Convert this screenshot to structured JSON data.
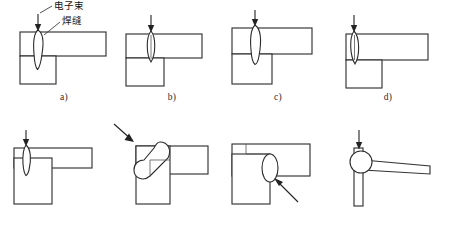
{
  "figure": {
    "background_color": "#ffffff",
    "line_color": "#333333",
    "annotation": {
      "beam_label": "电子束",
      "seam_label": "焊缝"
    }
  },
  "panels": [
    {
      "id": "a",
      "caption": "a)",
      "beam_direction": "vertical-down",
      "beam_position": "offset-left-on-top-bar",
      "weld_shape": "narrow-teardrop",
      "weld_penetration": "through-top-bar-into-lower-block",
      "joint_type": "T-joint",
      "has_labels": true
    },
    {
      "id": "b",
      "caption": "b)",
      "beam_direction": "vertical-down",
      "beam_position": "at-vertical-member-edge",
      "weld_shape": "vertical-lens",
      "weld_penetration": "full-thickness-of-top-bar",
      "joint_type": "T-joint",
      "has_labels": false
    },
    {
      "id": "c",
      "caption": "c)",
      "beam_direction": "vertical-down",
      "beam_position": "over-vertical-member",
      "weld_shape": "elongated-teardrop",
      "weld_penetration": "below-top-bar",
      "joint_type": "T-joint",
      "has_labels": false
    },
    {
      "id": "d",
      "caption": "d)",
      "beam_direction": "vertical-down",
      "beam_position": "left-edge-of-vertical-member",
      "weld_shape": "narrow-vertical-lens",
      "weld_penetration": "full-thickness-of-top-bar",
      "joint_type": "corner-joint",
      "has_labels": false
    },
    {
      "id": "e",
      "caption": "e)",
      "beam_direction": "vertical-down",
      "beam_position": "corner-of-thin-top-bar",
      "weld_shape": "small-teardrop",
      "weld_penetration": "through-thin-top-bar",
      "joint_type": "corner-joint",
      "has_labels": false
    },
    {
      "id": "f",
      "caption": "f)",
      "beam_direction": "diagonal-from-upper-left",
      "beam_position": "angled-at-outside-corner",
      "weld_shape": "diagonal-oblong",
      "weld_penetration": "across-corner-diagonally",
      "joint_type": "corner-joint",
      "has_labels": false
    },
    {
      "id": "g",
      "caption": "g)",
      "beam_direction": "diagonal-from-lower-right",
      "beam_position": "under-top-bar-at-junction",
      "weld_shape": "oval",
      "weld_penetration": "at-inner-junction",
      "joint_type": "lap-corner-joint",
      "has_labels": false
    },
    {
      "id": "h",
      "caption": "h)",
      "beam_direction": "vertical-down",
      "beam_position": "top-of-thin-vertical-sheet",
      "weld_shape": "circular",
      "weld_penetration": "sheet-junction",
      "joint_type": "thin-sheet-corner-joint",
      "has_labels": false
    }
  ]
}
